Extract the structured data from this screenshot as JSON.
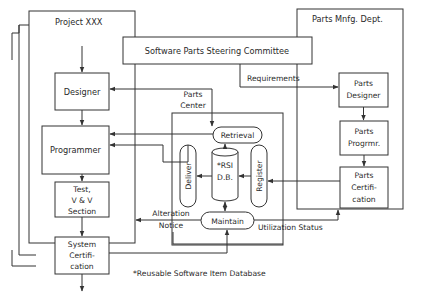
{
  "diagram": {
    "project": {
      "title": "Project XXX"
    },
    "steering_committee": {
      "label": "Software Parts Steering Committee"
    },
    "parts_mfg_dept": {
      "title": "Parts Mnfg. Dept."
    },
    "project_nodes": {
      "designer": "Designer",
      "programmer": "Programmer",
      "test": [
        "Test,",
        "V & V",
        "Section"
      ],
      "system_cert": [
        "System",
        "Certifi-",
        "cation"
      ]
    },
    "parts_nodes": {
      "parts_designer": [
        "Parts",
        "Designer"
      ],
      "parts_programmer": [
        "Parts",
        "Progrmr."
      ],
      "parts_cert": [
        "Parts",
        "Certifi-",
        "cation"
      ]
    },
    "parts_center": {
      "title": [
        "Parts",
        "Center"
      ],
      "retrieval": "Retrieval",
      "deliver": "Deliver",
      "register": "Register",
      "database": [
        "*RSI",
        "D.B."
      ],
      "maintain": "Maintain"
    },
    "edge_labels": {
      "requirements": "Requirements",
      "alteration_notice": [
        "Alteration",
        "Notice"
      ],
      "utilization_status": "Utilization Status"
    },
    "footnote": "*Reusable Software Item Database"
  }
}
